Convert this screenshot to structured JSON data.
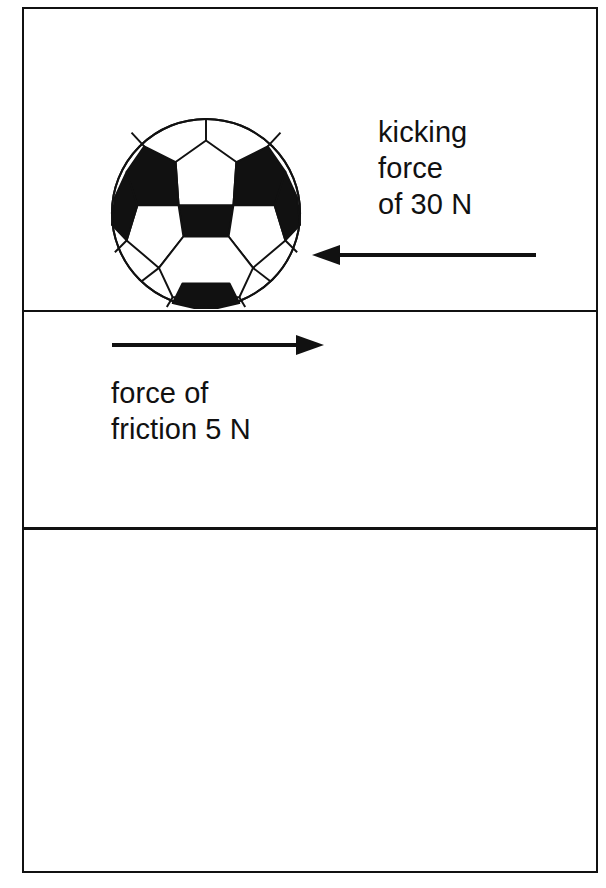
{
  "diagram": {
    "background_color": "#ffffff",
    "line_color": "#111111",
    "frame": {
      "border_width_px": 2,
      "x": 22,
      "y": 7,
      "width": 576,
      "height": 866
    },
    "rules": [
      {
        "name": "ground-line",
        "y": 301,
        "thickness_px": 2
      },
      {
        "name": "lower-divider",
        "y": 518,
        "thickness_px": 3
      }
    ],
    "ball": {
      "name": "soccer-ball",
      "center_x": 203,
      "center_y": 204,
      "radius": 95,
      "panel_fill_dark": "#111111",
      "panel_fill_light": "#ffffff",
      "resting_on": "ground-line"
    },
    "forces": [
      {
        "id": "kicking-force",
        "label": "kicking\nforce\nof 30 N",
        "label_lines": [
          "kicking",
          "force",
          "of 30 N"
        ],
        "magnitude": "30",
        "unit": "N",
        "direction": "left",
        "arrow_tip_x": 310,
        "arrow_tail_x": 518,
        "arrow_y": 246
      },
      {
        "id": "friction-force",
        "label": "force of\nfriction 5 N",
        "label_lines": [
          "force of",
          "friction 5 N"
        ],
        "magnitude": "5",
        "unit": "N",
        "direction": "right",
        "arrow_tip_x": 313,
        "arrow_tail_x": 112,
        "arrow_y": 336
      }
    ],
    "work_regions": [
      {
        "name": "middle-work-region",
        "label": ""
      },
      {
        "name": "bottom-work-region",
        "label": ""
      }
    ]
  }
}
